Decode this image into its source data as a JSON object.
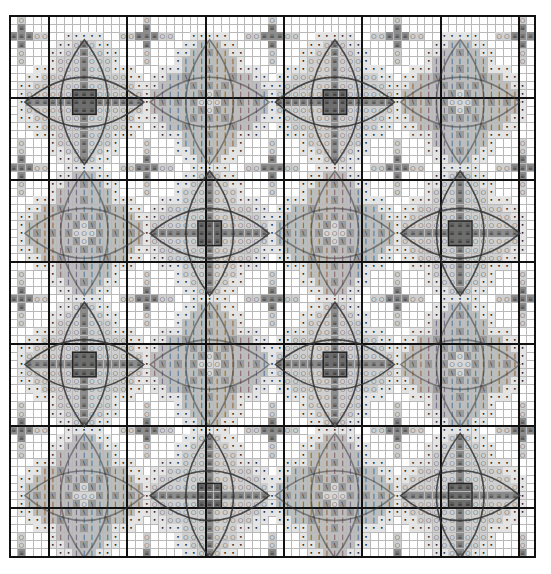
{
  "chart_title": "",
  "grid": {
    "cols": 67,
    "rows": 66,
    "cell_w": 7.83,
    "cell_h": 8.2,
    "major_every": 10,
    "major_col_offset": 5,
    "major_row_offset": 10,
    "line_color": "#b8b8b8",
    "major_line_color": "#111111"
  },
  "symbols": {
    "equals": {
      "glyph": "≡",
      "bg": "#8c8c8c",
      "color": "#333333",
      "name": "equals-symbol"
    },
    "circle": {
      "glyph": "○",
      "bg": "#cfcfcf",
      "color": "#444444",
      "name": "circle-symbol"
    },
    "dot": {
      "glyph": "•",
      "bg": "#e4e4e4",
      "color": "#111111",
      "name": "dot-symbol"
    },
    "bar": {
      "glyph": "ǀ",
      "bg": "#bdbdbd",
      "color": "#333333",
      "name": "t-bar-symbol"
    },
    "slash": {
      "glyph": "\\",
      "bg": "#9a9a9a",
      "color": "#111111",
      "name": "backslash-symbol"
    },
    "dark": {
      "glyph": "≡",
      "bg": "#6e6e6e",
      "color": "#222222",
      "name": "dark-center-symbol"
    },
    "ring": {
      "glyph": "○",
      "bg": "#d6d6d6",
      "color": "#333333",
      "name": "ring-center-symbol"
    }
  },
  "motifs": {
    "pitch_cols": 16,
    "pitch_rows": 16,
    "origin_col": 9,
    "origin_row": 10,
    "layout": [
      [
        "A",
        "B",
        "A",
        "B"
      ],
      [
        "B",
        "A",
        "B",
        "A"
      ],
      [
        "A",
        "B",
        "A",
        "B"
      ],
      [
        "B",
        "A",
        "B",
        "A"
      ]
    ],
    "arm_length": 7,
    "petal_half_width": 3
  },
  "fillers": {
    "description": "small equals/circle crosses between motifs",
    "arm_length": 3
  },
  "outline_color": "#333333"
}
